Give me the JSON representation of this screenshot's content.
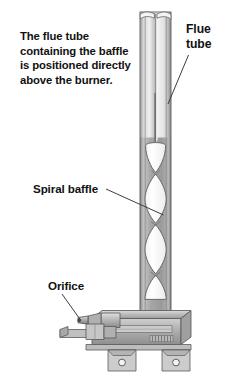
{
  "figure": {
    "background_color": "#ffffff"
  },
  "note": {
    "lines": [
      "The flue tube",
      "containing the baffle",
      "is positioned directly",
      "above the burner."
    ]
  },
  "labels": {
    "flue_tube": {
      "lines": [
        "Flue",
        "tube"
      ]
    },
    "spiral_baffle": {
      "text": "Spiral baffle"
    },
    "orifice": {
      "text": "Orifice"
    }
  },
  "colors": {
    "outline": "#4a4a4a",
    "tube_wall": "#9b9b9b",
    "tube_wall_light": "#c9c9c9",
    "tube_wall_dark": "#7e7e7e",
    "baffle_fill": "#fbfbfb",
    "burner_body": "#b4b4b4",
    "burner_light": "#d2d2d2",
    "burner_dark": "#8d8d8d",
    "text": "#111111",
    "leader_line": "#3c3c3c"
  },
  "geometry": {
    "tube": {
      "left_x": 140,
      "right_x": 171,
      "top_y": 12,
      "bottom_y": 318,
      "wall_thickness": 5
    },
    "baffle": {
      "segment_count": 4,
      "top_y": 145,
      "bottom_y": 300,
      "rod_top_y": 93
    },
    "burner": {
      "top_y": 303,
      "bottom_y": 372,
      "left_x": 60,
      "right_x": 196,
      "mount_feet": 2
    }
  }
}
